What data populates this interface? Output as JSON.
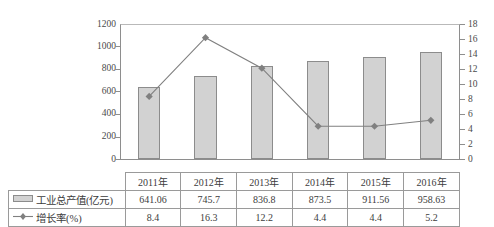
{
  "chart_data": {
    "type": "bar",
    "title": "",
    "xlabel": "",
    "categories": [
      "2011年",
      "2012年",
      "2013年",
      "2014年",
      "2015年",
      "2016年"
    ],
    "series": [
      {
        "name": "工业总产值(亿元)",
        "type": "bar",
        "axis": "left",
        "values": [
          641.06,
          745.7,
          836.8,
          873.5,
          911.56,
          958.63
        ],
        "color": "#d2d2d2",
        "border_color": "#8c8c8c"
      },
      {
        "name": "增长率(%)",
        "type": "line",
        "axis": "right",
        "values": [
          8.4,
          16.3,
          12.2,
          4.4,
          4.4,
          5.2
        ],
        "color": "#808080",
        "marker": "diamond"
      }
    ],
    "left_axis": {
      "label": "",
      "ylim": [
        0,
        1200
      ],
      "ticks": [
        0,
        200,
        400,
        600,
        800,
        1000,
        1200
      ],
      "tick_labels": [
        "0",
        "200",
        "400",
        "600",
        "800",
        "1000",
        "1200"
      ]
    },
    "right_axis": {
      "label": "",
      "ylim": [
        0,
        18
      ],
      "ticks": [
        0,
        2,
        4,
        6,
        8,
        10,
        12,
        14,
        16,
        18
      ],
      "tick_labels": [
        "0",
        "2",
        "4",
        "6",
        "8",
        "10",
        "12",
        "14",
        "16",
        "18"
      ]
    },
    "grid": false,
    "legend_position": "table-row-labels"
  },
  "table": {
    "year_header": [
      "2011年",
      "2012年",
      "2013年",
      "2014年",
      "2015年",
      "2016年"
    ],
    "rows": [
      {
        "label": "工业总产值(亿元)",
        "swatch": "bar-swatch",
        "values": [
          "641.06",
          "745.7",
          "836.8",
          "873.5",
          "911.56",
          "958.63"
        ]
      },
      {
        "label": "增长率(%)",
        "swatch": "line-marker-swatch",
        "values": [
          "8.4",
          "16.3",
          "12.2",
          "4.4",
          "4.4",
          "5.2"
        ]
      }
    ]
  },
  "colors": {
    "bar_fill": "#d2d2d2",
    "bar_border": "#8c8c8c",
    "line": "#808080",
    "axis": "#8e8e8e",
    "text": "#3c3c3c"
  }
}
